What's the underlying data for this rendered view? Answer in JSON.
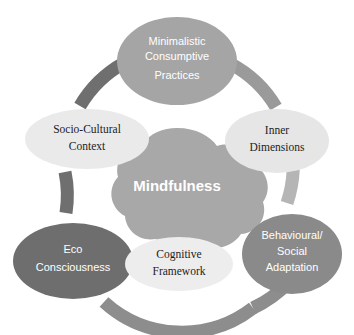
{
  "diagram": {
    "type": "circular-cycle",
    "background_color": "#ffffff",
    "center": {
      "label": "Mindfulness",
      "fill": "#a8a8a8",
      "text_color": "#ffffff",
      "shape": "cloud-blob"
    },
    "ring": {
      "stroke_width": 13,
      "segments": [
        {
          "name": "arc-top-left",
          "color": "#6f6f6f"
        },
        {
          "name": "arc-top-right",
          "color": "#9a9a9a"
        },
        {
          "name": "arc-right",
          "color": "#b5b5b5"
        },
        {
          "name": "arc-bottom-right",
          "color": "#8d8d8d"
        },
        {
          "name": "arc-bottom",
          "color": "#8d8d8d"
        },
        {
          "name": "arc-left",
          "color": "#6f6f6f"
        }
      ]
    },
    "nodes": [
      {
        "id": "minimalistic-consumptive-practices",
        "lines": [
          "Minimalistic",
          "Consumptive",
          "Practices"
        ],
        "fill": "#a5a5a5",
        "text_color": "#ffffff",
        "font_style": "sans",
        "cx": 177,
        "cy": 61,
        "rx": 60,
        "ry": 44
      },
      {
        "id": "socio-cultural-context",
        "lines": [
          "Socio-Cultural",
          "Context"
        ],
        "fill": "#eaeaea",
        "text_color": "#1d1d1d",
        "font_style": "serif",
        "cx": 87,
        "cy": 139,
        "rx": 62,
        "ry": 30
      },
      {
        "id": "inner-dimensions",
        "lines": [
          "Inner",
          "Dimensions"
        ],
        "fill": "#e6e6e6",
        "text_color": "#1d1d1d",
        "font_style": "serif",
        "cx": 277,
        "cy": 141,
        "rx": 52,
        "ry": 32
      },
      {
        "id": "eco-consciousness",
        "lines": [
          "Eco",
          "Consciousness"
        ],
        "fill": "#6e6e6e",
        "text_color": "#ffffff",
        "font_style": "sans",
        "cx": 73,
        "cy": 261,
        "rx": 60,
        "ry": 38
      },
      {
        "id": "cognitive-framework",
        "lines": [
          "Cognitive",
          "Framework"
        ],
        "fill": "#ededed",
        "text_color": "#1d1d1d",
        "font_style": "serif",
        "cx": 179,
        "cy": 264,
        "rx": 54,
        "ry": 27
      },
      {
        "id": "behavioural-social-adaptation",
        "lines": [
          "Behavioural/",
          "Social",
          "Adaptation"
        ],
        "fill": "#8a8a8a",
        "text_color": "#ffffff",
        "font_style": "sans",
        "cx": 292,
        "cy": 254,
        "rx": 50,
        "ry": 40
      }
    ]
  }
}
